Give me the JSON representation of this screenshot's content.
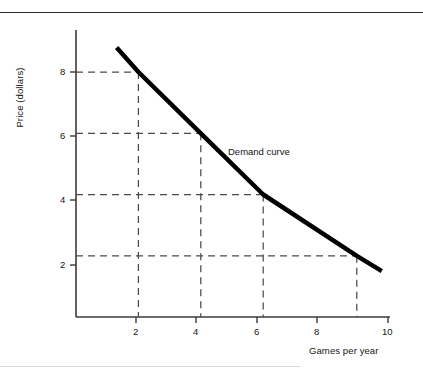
{
  "figure": {
    "name": "demand-curve-figure",
    "series_label": "Demand curve",
    "ylabel": "Price (dollars)",
    "xlabel": "Games per year"
  },
  "chart_data": {
    "type": "line",
    "title": "",
    "subtitle": "",
    "xlabel": "Games per year",
    "ylabel": "Price (dollars)",
    "xlim": [
      0,
      10
    ],
    "ylim": [
      0,
      9.5
    ],
    "xticks": [
      2,
      4,
      6,
      8,
      10
    ],
    "xticklabels": [
      "2",
      "4",
      "6",
      "8",
      "10"
    ],
    "yticks": [
      2,
      4,
      6,
      8
    ],
    "yticklabels": [
      "2",
      "4",
      "6",
      "8"
    ],
    "grid": false,
    "legend": "none",
    "annotations": [
      {
        "text": "Demand curve",
        "x": 6.0,
        "y": 5.1
      }
    ],
    "series": [
      {
        "name": "Demand curve",
        "color": "#000000",
        "linewidth": 4.5,
        "x": [
          1.3,
          2.0,
          4.0,
          6.0,
          9.0,
          9.8
        ],
        "y": [
          8.8,
          8.0,
          6.0,
          4.0,
          2.0,
          1.5
        ]
      }
    ],
    "guide_points": [
      {
        "x": 2.0,
        "y": 8.0
      },
      {
        "x": 4.0,
        "y": 6.0
      },
      {
        "x": 6.0,
        "y": 4.0
      },
      {
        "x": 9.0,
        "y": 2.0
      }
    ]
  },
  "ticks": {
    "x": [
      {
        "label": "2",
        "value": 2
      },
      {
        "label": "4",
        "value": 4
      },
      {
        "label": "6",
        "value": 6
      },
      {
        "label": "8",
        "value": 8
      },
      {
        "label": "10",
        "value": 10
      }
    ],
    "y": [
      {
        "label": "8",
        "value": 8
      },
      {
        "label": "6",
        "value": 6
      },
      {
        "label": "4",
        "value": 4
      },
      {
        "label": "2",
        "value": 2
      }
    ]
  },
  "colors": {
    "curve": "#000000",
    "axis": "#3a3a3a",
    "guide": "#4a4a4a",
    "rule": "#2b2b2b",
    "text": "#151515",
    "background": "#ffffff"
  }
}
